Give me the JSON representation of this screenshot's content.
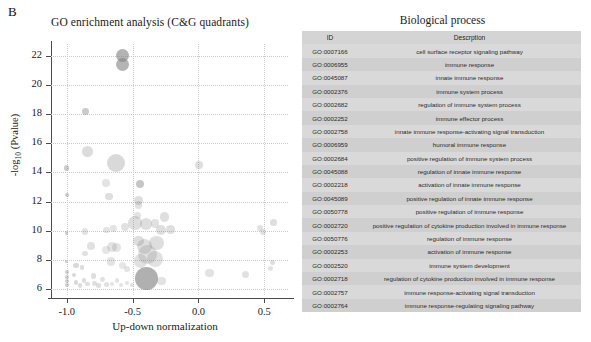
{
  "panel_label": "B",
  "chart_data": {
    "type": "scatter",
    "title": "GO enrichment analysis (C&G quadrants)",
    "xlabel": "Up-down normalization",
    "ylabel": "-log10 (Pvalue)",
    "xlim": [
      -1.12,
      0.68
    ],
    "ylim": [
      5.6,
      22.8
    ],
    "xticks": [
      -1.0,
      -0.5,
      0.0,
      0.5
    ],
    "xtick_labels": [
      "-1.0",
      "-0.5",
      "0.0",
      "0.5"
    ],
    "yticks": [
      6,
      8,
      10,
      12,
      14,
      16,
      18,
      20,
      22
    ],
    "ytick_labels": [
      "6",
      "8",
      "10",
      "12",
      "14",
      "16",
      "18",
      "20",
      "22"
    ],
    "grid": true,
    "grid_style": "dotted",
    "marker_color": "#808080",
    "size_encodes": "gene count",
    "points": [
      {
        "x": -0.575,
        "y": 22.0,
        "size": 6.5,
        "alpha": 0.6
      },
      {
        "x": -0.575,
        "y": 21.4,
        "size": 6.5,
        "alpha": 0.58
      },
      {
        "x": -0.855,
        "y": 18.15,
        "size": 3.4,
        "alpha": 0.42
      },
      {
        "x": -0.845,
        "y": 15.45,
        "size": 5.4,
        "alpha": 0.28
      },
      {
        "x": -0.625,
        "y": 14.65,
        "size": 9.0,
        "alpha": 0.3
      },
      {
        "x": -1.0,
        "y": 14.3,
        "size": 2.6,
        "alpha": 0.4
      },
      {
        "x": 0.005,
        "y": 14.5,
        "size": 4.2,
        "alpha": 0.26
      },
      {
        "x": -0.705,
        "y": 13.3,
        "size": 4.0,
        "alpha": 0.22
      },
      {
        "x": -0.445,
        "y": 13.2,
        "size": 4.2,
        "alpha": 0.45
      },
      {
        "x": -1.0,
        "y": 12.45,
        "size": 1.9,
        "alpha": 0.4
      },
      {
        "x": -0.68,
        "y": 12.35,
        "size": 3.6,
        "alpha": 0.26
      },
      {
        "x": -0.455,
        "y": 12.05,
        "size": 4.6,
        "alpha": 0.26
      },
      {
        "x": -0.455,
        "y": 11.75,
        "size": 3.8,
        "alpha": 0.24
      },
      {
        "x": -0.255,
        "y": 10.95,
        "size": 4.6,
        "alpha": 0.26
      },
      {
        "x": -0.48,
        "y": 10.55,
        "size": 6.8,
        "alpha": 0.26
      },
      {
        "x": -0.395,
        "y": 10.45,
        "size": 6.0,
        "alpha": 0.26
      },
      {
        "x": -0.33,
        "y": 10.5,
        "size": 4.4,
        "alpha": 0.24
      },
      {
        "x": -0.56,
        "y": 10.25,
        "size": 4.2,
        "alpha": 0.24
      },
      {
        "x": -0.285,
        "y": 10.05,
        "size": 5.0,
        "alpha": 0.26
      },
      {
        "x": -0.215,
        "y": 10.1,
        "size": 4.4,
        "alpha": 0.26
      },
      {
        "x": -0.645,
        "y": 10.15,
        "size": 3.4,
        "alpha": 0.22
      },
      {
        "x": -0.7,
        "y": 10.05,
        "size": 3.4,
        "alpha": 0.22
      },
      {
        "x": -0.86,
        "y": 9.95,
        "size": 3.2,
        "alpha": 0.22
      },
      {
        "x": 0.465,
        "y": 10.2,
        "size": 3.0,
        "alpha": 0.24
      },
      {
        "x": 0.57,
        "y": 10.55,
        "size": 3.6,
        "alpha": 0.26
      },
      {
        "x": 0.49,
        "y": 9.9,
        "size": 3.0,
        "alpha": 0.24
      },
      {
        "x": -1.0,
        "y": 9.85,
        "size": 1.7,
        "alpha": 0.38
      },
      {
        "x": -0.455,
        "y": 9.3,
        "size": 5.4,
        "alpha": 0.26
      },
      {
        "x": -0.41,
        "y": 8.95,
        "size": 7.6,
        "alpha": 0.26
      },
      {
        "x": -0.32,
        "y": 9.15,
        "size": 7.2,
        "alpha": 0.26
      },
      {
        "x": -0.815,
        "y": 8.95,
        "size": 3.8,
        "alpha": 0.24
      },
      {
        "x": -0.66,
        "y": 8.9,
        "size": 5.0,
        "alpha": 0.22
      },
      {
        "x": -0.62,
        "y": 8.85,
        "size": 4.4,
        "alpha": 0.22
      },
      {
        "x": -0.7,
        "y": 8.7,
        "size": 4.0,
        "alpha": 0.2
      },
      {
        "x": -0.39,
        "y": 8.35,
        "size": 9.5,
        "alpha": 0.24
      },
      {
        "x": -0.33,
        "y": 8.1,
        "size": 8.0,
        "alpha": 0.24
      },
      {
        "x": -0.44,
        "y": 7.95,
        "size": 6.8,
        "alpha": 0.24
      },
      {
        "x": -0.665,
        "y": 7.9,
        "size": 4.2,
        "alpha": 0.22
      },
      {
        "x": -1.0,
        "y": 7.9,
        "size": 1.7,
        "alpha": 0.38
      },
      {
        "x": -0.93,
        "y": 7.6,
        "size": 2.6,
        "alpha": 0.3
      },
      {
        "x": -0.885,
        "y": 7.5,
        "size": 2.4,
        "alpha": 0.28
      },
      {
        "x": 0.56,
        "y": 7.85,
        "size": 2.6,
        "alpha": 0.26
      },
      {
        "x": 0.545,
        "y": 7.4,
        "size": 2.4,
        "alpha": 0.24
      },
      {
        "x": 0.085,
        "y": 7.1,
        "size": 4.2,
        "alpha": 0.22
      },
      {
        "x": 0.36,
        "y": 7.0,
        "size": 3.6,
        "alpha": 0.24
      },
      {
        "x": -0.395,
        "y": 6.7,
        "size": 11.5,
        "alpha": 0.62
      },
      {
        "x": -0.28,
        "y": 6.55,
        "size": 4.2,
        "alpha": 0.22
      },
      {
        "x": -1.0,
        "y": 7.15,
        "size": 2.0,
        "alpha": 0.38
      },
      {
        "x": -1.0,
        "y": 6.85,
        "size": 2.0,
        "alpha": 0.38
      },
      {
        "x": -1.0,
        "y": 6.55,
        "size": 2.0,
        "alpha": 0.38
      },
      {
        "x": -1.0,
        "y": 6.3,
        "size": 2.0,
        "alpha": 0.38
      },
      {
        "x": -0.945,
        "y": 6.95,
        "size": 2.2,
        "alpha": 0.3
      },
      {
        "x": -0.93,
        "y": 6.45,
        "size": 2.2,
        "alpha": 0.3
      },
      {
        "x": -0.9,
        "y": 6.25,
        "size": 2.4,
        "alpha": 0.28
      },
      {
        "x": -0.87,
        "y": 6.6,
        "size": 2.2,
        "alpha": 0.28
      },
      {
        "x": -0.84,
        "y": 6.35,
        "size": 2.4,
        "alpha": 0.26
      },
      {
        "x": -0.8,
        "y": 6.9,
        "size": 2.6,
        "alpha": 0.26
      },
      {
        "x": -0.79,
        "y": 6.4,
        "size": 2.4,
        "alpha": 0.26
      },
      {
        "x": -0.76,
        "y": 6.25,
        "size": 2.2,
        "alpha": 0.26
      },
      {
        "x": -0.73,
        "y": 6.65,
        "size": 2.4,
        "alpha": 0.24
      },
      {
        "x": -0.7,
        "y": 6.3,
        "size": 2.6,
        "alpha": 0.24
      },
      {
        "x": -0.655,
        "y": 6.35,
        "size": 2.2,
        "alpha": 0.24
      },
      {
        "x": -0.62,
        "y": 6.6,
        "size": 2.2,
        "alpha": 0.22
      },
      {
        "x": -0.585,
        "y": 6.3,
        "size": 2.0,
        "alpha": 0.22
      },
      {
        "x": -0.545,
        "y": 6.45,
        "size": 2.0,
        "alpha": 0.22
      },
      {
        "x": -0.505,
        "y": 6.3,
        "size": 2.2,
        "alpha": 0.22
      },
      {
        "x": -0.545,
        "y": 7.35,
        "size": 3.0,
        "alpha": 0.22
      },
      {
        "x": -0.575,
        "y": 7.6,
        "size": 3.4,
        "alpha": 0.2
      },
      {
        "x": -0.86,
        "y": 8.45,
        "size": 2.8,
        "alpha": 0.24
      },
      {
        "x": -0.465,
        "y": 11.05,
        "size": 3.4,
        "alpha": 0.22
      }
    ]
  },
  "table": {
    "title": "Biological process",
    "columns": [
      "ID",
      "Descrption"
    ],
    "rows": [
      {
        "id": "GO:0007166",
        "description": "cell surface receptor signaling pathway"
      },
      {
        "id": "GO:0006955",
        "description": "immune response"
      },
      {
        "id": "GO:0045087",
        "description": "innate immune response"
      },
      {
        "id": "GO:0002376",
        "description": "immune system process"
      },
      {
        "id": "GO:0002682",
        "description": "regulation of immune system process"
      },
      {
        "id": "GO:0002252",
        "description": "immune effector process"
      },
      {
        "id": "GO:0002758",
        "description": "innate immune response-activating signal transduction"
      },
      {
        "id": "GO:0006959",
        "description": "humoral immune response"
      },
      {
        "id": "GO:0002684",
        "description": "positive regulation of immune system process"
      },
      {
        "id": "GO:0045088",
        "description": "regulation of innate immune response"
      },
      {
        "id": "GO:0002218",
        "description": "activation of innate immune response"
      },
      {
        "id": "GO:0045089",
        "description": "positive regulation of innate immune response"
      },
      {
        "id": "GO:0050778",
        "description": "positive regulation of immune response"
      },
      {
        "id": "GO:0002720",
        "description": "positive regulation of cytokine production involved in immune response"
      },
      {
        "id": "GO:0050776",
        "description": "regulation of immune response"
      },
      {
        "id": "GO:0002253",
        "description": "activation of immune response"
      },
      {
        "id": "GO:0002520",
        "description": "immune system development"
      },
      {
        "id": "GO:0002718",
        "description": "regulation of cytokine production involved in immune response"
      },
      {
        "id": "GO:0002757",
        "description": "immune response-activating signal transduction"
      },
      {
        "id": "GO:0002764",
        "description": "immune response-regulating signaling pathway"
      }
    ]
  }
}
